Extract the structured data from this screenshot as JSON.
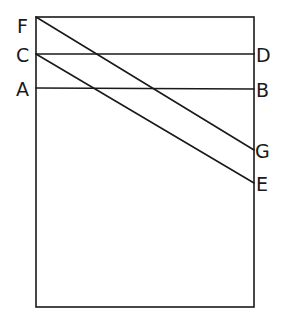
{
  "diagram": {
    "rectangle": {
      "x1": 36,
      "y1": 17,
      "x2": 254,
      "y2": 307
    },
    "points": {
      "F": {
        "label": "F",
        "x": 36,
        "y": 17
      },
      "C": {
        "label": "C",
        "x": 36,
        "y": 54
      },
      "A": {
        "label": "A",
        "x": 36,
        "y": 88
      },
      "D": {
        "label": "D",
        "x": 254,
        "y": 54
      },
      "B": {
        "label": "B",
        "x": 254,
        "y": 89
      },
      "G": {
        "label": "G",
        "x": 254,
        "y": 150
      },
      "E": {
        "label": "E",
        "x": 254,
        "y": 183
      }
    },
    "segments": [
      {
        "name": "CD",
        "from": "C",
        "to": "D"
      },
      {
        "name": "AB",
        "from": "A",
        "to": "B"
      },
      {
        "name": "FG",
        "from": "F",
        "to": "G"
      },
      {
        "name": "CE",
        "from": "C",
        "to": "E"
      }
    ],
    "stroke_color": "#1a1a1a"
  }
}
